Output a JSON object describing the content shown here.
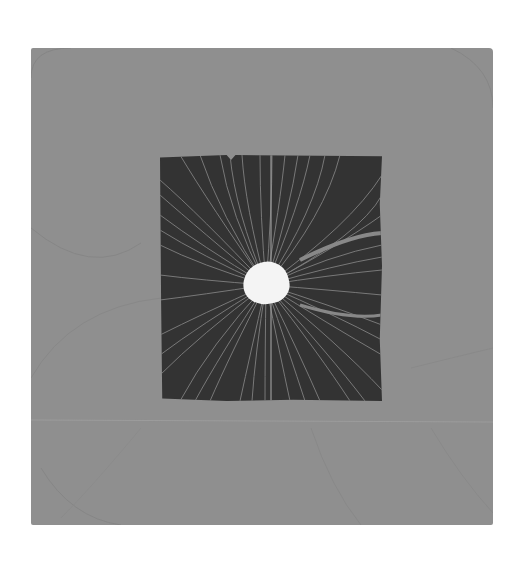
{
  "image": {
    "subject": "Iron filings field pattern on card",
    "colors": {
      "background": "#ffffff",
      "card": "#8f8f8f",
      "plate": "#333333",
      "filings": "#9a9a9a",
      "hole": "#f4f4f4"
    }
  }
}
